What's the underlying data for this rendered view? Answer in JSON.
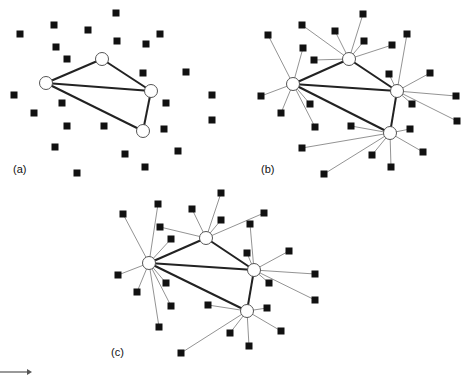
{
  "style": {
    "edge_color": "#222222",
    "node_fill": "#ffffff",
    "node_stroke": "#555555",
    "square_fill": "#111111"
  },
  "panels": [
    {
      "label": "(a)",
      "label_pos": [
        13,
        163
      ],
      "hubs": [
        [
          102,
          59
        ],
        [
          46,
          83
        ],
        [
          151,
          91
        ],
        [
          143,
          131
        ]
      ],
      "hub_edges": [
        [
          0,
          1
        ],
        [
          1,
          2
        ],
        [
          0,
          2
        ],
        [
          1,
          3
        ],
        [
          2,
          3
        ]
      ],
      "squares": [
        [
          116,
          13
        ],
        [
          54,
          25
        ],
        [
          20,
          34
        ],
        [
          88,
          30
        ],
        [
          117,
          41
        ],
        [
          56,
          47
        ],
        [
          160,
          34
        ],
        [
          146,
          44
        ],
        [
          67,
          59
        ],
        [
          143,
          73
        ],
        [
          186,
          72
        ],
        [
          212,
          95
        ],
        [
          14,
          95
        ],
        [
          62,
          103
        ],
        [
          34,
          113
        ],
        [
          166,
          103
        ],
        [
          67,
          126
        ],
        [
          104,
          126
        ],
        [
          164,
          129
        ],
        [
          212,
          120
        ],
        [
          55,
          147
        ],
        [
          125,
          154
        ],
        [
          178,
          151
        ],
        [
          145,
          167
        ],
        [
          77,
          173
        ]
      ],
      "square_links": []
    },
    {
      "label": "(b)",
      "label_pos": [
        261,
        163
      ],
      "hubs": [
        [
          349,
          59
        ],
        [
          293,
          84
        ],
        [
          397,
          91
        ],
        [
          390,
          133
        ]
      ],
      "hub_edges": [
        [
          0,
          1
        ],
        [
          1,
          2
        ],
        [
          0,
          2
        ],
        [
          1,
          3
        ],
        [
          2,
          3
        ]
      ],
      "squares": [
        [
          363,
          14
        ],
        [
          302,
          25
        ],
        [
          268,
          35
        ],
        [
          335,
          31
        ],
        [
          364,
          41
        ],
        [
          407,
          34
        ],
        [
          392,
          45
        ],
        [
          303,
          48
        ],
        [
          314,
          60
        ],
        [
          389,
          74
        ],
        [
          430,
          73
        ],
        [
          261,
          96
        ],
        [
          456,
          96
        ],
        [
          310,
          104
        ],
        [
          412,
          104
        ],
        [
          281,
          113
        ],
        [
          457,
          121
        ],
        [
          315,
          127
        ],
        [
          351,
          126
        ],
        [
          410,
          129
        ],
        [
          302,
          148
        ],
        [
          423,
          152
        ],
        [
          372,
          155
        ],
        [
          391,
          167
        ],
        [
          324,
          174
        ]
      ],
      "square_links": [
        0,
        0,
        1,
        0,
        0,
        2,
        0,
        1,
        0,
        2,
        2,
        1,
        2,
        1,
        2,
        1,
        2,
        1,
        3,
        3,
        3,
        3,
        3,
        3,
        3
      ]
    },
    {
      "label": "(c)",
      "label_pos": [
        111,
        346
      ],
      "hubs": [
        [
          206,
          238
        ],
        [
          149,
          263
        ],
        [
          254,
          270
        ],
        [
          247,
          311
        ]
      ],
      "hub_edges": [
        [
          0,
          1
        ],
        [
          1,
          2
        ],
        [
          0,
          2
        ],
        [
          1,
          3
        ],
        [
          2,
          3
        ]
      ],
      "squares": [
        [
          221,
          193
        ],
        [
          158,
          204
        ],
        [
          123,
          214
        ],
        [
          192,
          209
        ],
        [
          264,
          213
        ],
        [
          221,
          220
        ],
        [
          160,
          227
        ],
        [
          250,
          224
        ],
        [
          171,
          239
        ],
        [
          247,
          253
        ],
        [
          289,
          251
        ],
        [
          118,
          275
        ],
        [
          315,
          274
        ],
        [
          166,
          283
        ],
        [
          269,
          283
        ],
        [
          137,
          292
        ],
        [
          315,
          300
        ],
        [
          171,
          306
        ],
        [
          208,
          305
        ],
        [
          267,
          308
        ],
        [
          159,
          327
        ],
        [
          281,
          331
        ],
        [
          230,
          333
        ],
        [
          249,
          346
        ],
        [
          181,
          353
        ]
      ],
      "square_links": [
        0,
        1,
        1,
        0,
        0,
        0,
        0,
        2,
        1,
        2,
        2,
        1,
        2,
        1,
        2,
        1,
        2,
        1,
        3,
        3,
        1,
        3,
        3,
        3,
        3
      ]
    }
  ],
  "arrow": {
    "from": [
      0,
      372
    ],
    "to": [
      32,
      372
    ]
  }
}
